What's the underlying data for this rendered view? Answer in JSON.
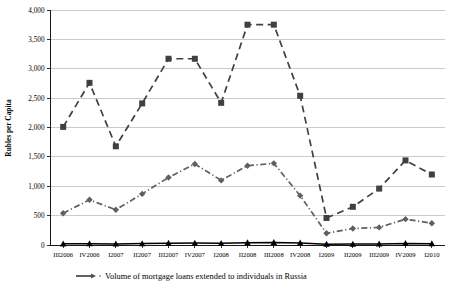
{
  "chart_data": {
    "type": "line",
    "title": "",
    "xlabel": "",
    "ylabel": "Rubles per Capita",
    "categories": [
      "III2006",
      "IV2006",
      "I2007",
      "II2007",
      "III2007",
      "IV2007",
      "I2008",
      "II2008",
      "III2008",
      "IV2008",
      "I2009",
      "II2009",
      "III2009",
      "IV2009",
      "I2010"
    ],
    "ylim": [
      0,
      4000
    ],
    "ytick_labels": [
      "0",
      "500",
      "1,000",
      "1,500",
      "2,000",
      "2,500",
      "3,000",
      "3,500",
      "4,000"
    ],
    "ytick_values": [
      0,
      500,
      1000,
      1500,
      2000,
      2500,
      3000,
      3500,
      4000
    ],
    "grid": true,
    "legend_position": "bottom",
    "series": [
      {
        "name": "series-dashed-squares",
        "marker": "square",
        "line_style": "dashed",
        "color": "#404040",
        "values": [
          2010,
          2760,
          1680,
          2410,
          3170,
          3170,
          2420,
          3750,
          3750,
          2540,
          460,
          650,
          960,
          1440,
          1200
        ]
      },
      {
        "name": "series-dashdot-diamonds",
        "marker": "diamond",
        "line_style": "dash-dot",
        "color": "#606060",
        "values": [
          540,
          770,
          600,
          870,
          1150,
          1380,
          1100,
          1350,
          1390,
          840,
          200,
          280,
          300,
          440,
          370
        ]
      },
      {
        "name": "series-solid-triangles",
        "marker": "triangle",
        "line_style": "solid",
        "color": "#000000",
        "values": [
          20,
          22,
          18,
          24,
          30,
          32,
          28,
          40,
          44,
          34,
          14,
          16,
          18,
          26,
          22
        ]
      }
    ],
    "legend": [
      {
        "label": "Volume of mortgage loans extended to individuals in Russia",
        "marker": "line-arrow",
        "color": "#505050"
      }
    ]
  }
}
